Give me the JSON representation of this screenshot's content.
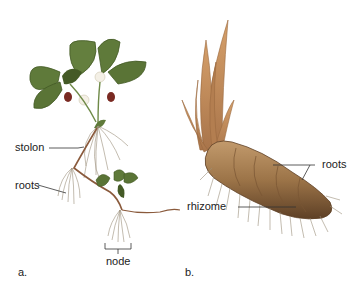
{
  "figure": {
    "panel_a": {
      "letter": "a.",
      "subject": "strawberry plant",
      "labels": {
        "stolon": "stolon",
        "roots": "roots",
        "node": "node"
      }
    },
    "panel_b": {
      "letter": "b.",
      "subject": "iris rhizome",
      "labels": {
        "roots": "roots",
        "rhizome": "rhizome"
      }
    }
  },
  "colors": {
    "leaf": "#5f7a3a",
    "leaf_dark": "#445a26",
    "stem": "#8a5a3c",
    "root": "#9a8f7a",
    "rhizome": "#9c7448",
    "rhizome_dark": "#6e4d2c",
    "iris_leaf": "#c08a5a",
    "berry": "#7a2a22",
    "flower": "#f4f0e6"
  }
}
